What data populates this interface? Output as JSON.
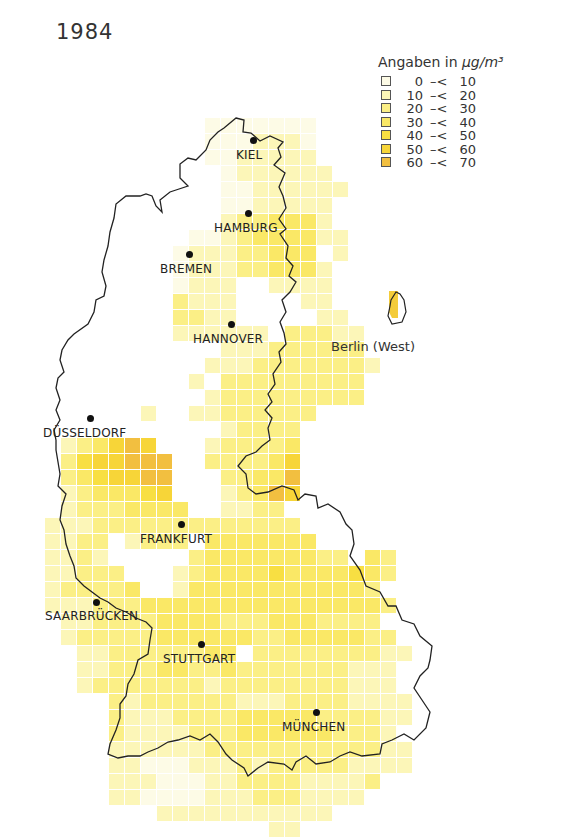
{
  "title": "1984",
  "legend": {
    "title_prefix": "Angaben in ",
    "title_unit": "µg/m³",
    "classes": [
      {
        "lo": "0",
        "sep": "–<",
        "hi": "10",
        "color": "#fdfbe6"
      },
      {
        "lo": "10",
        "sep": "–<",
        "hi": "20",
        "color": "#fcf6b8"
      },
      {
        "lo": "20",
        "sep": "–<",
        "hi": "30",
        "color": "#fbef86"
      },
      {
        "lo": "30",
        "sep": "–<",
        "hi": "40",
        "color": "#fae866"
      },
      {
        "lo": "40",
        "sep": "–<",
        "hi": "50",
        "color": "#f8df42"
      },
      {
        "lo": "50",
        "sep": "–<",
        "hi": "60",
        "color": "#f7d538"
      },
      {
        "lo": "60",
        "sep": "–<",
        "hi": "70",
        "color": "#f2bf40"
      }
    ]
  },
  "cities": [
    {
      "name": "KIEL",
      "dot": [
        253,
        140
      ],
      "label": [
        236,
        148
      ]
    },
    {
      "name": "HAMBURG",
      "dot": [
        248,
        213
      ],
      "label": [
        214,
        221
      ]
    },
    {
      "name": "BREMEN",
      "dot": [
        189,
        254
      ],
      "label": [
        160,
        262
      ]
    },
    {
      "name": "HANNOVER",
      "dot": [
        231,
        324
      ],
      "label": [
        193,
        332
      ]
    },
    {
      "name": "DÜSSELDORF",
      "dot": [
        90,
        418
      ],
      "label": [
        43,
        426
      ]
    },
    {
      "name": "FRANKFURT",
      "dot": [
        181,
        524
      ],
      "label": [
        140,
        532
      ]
    },
    {
      "name": "SAARBRÜCKEN",
      "dot": [
        96,
        602
      ],
      "label": [
        45,
        609
      ]
    },
    {
      "name": "STUTTGART",
      "dot": [
        201,
        644
      ],
      "label": [
        163,
        652
      ]
    },
    {
      "name": "MÜNCHEN",
      "dot": [
        316,
        712
      ],
      "label": [
        282,
        720
      ]
    }
  ],
  "berlin_label": "Berlin (West)",
  "grid": {
    "origin": [
      45,
      118
    ],
    "cell": 16,
    "rows": [
      "..........0000000........",
      "..........0001110........",
      "..........0011111........",
      "...........0111111.......",
      "...........00111111......",
      "...........0011111.......",
      "...........1223331.......",
      ".........0012333311......",
      "........011122333.1......",
      "........0111223331.......",
      "........0111..1111.......",
      "........2111....11.......",
      "........2211.....11......",
      "........111111.22211.....",
      "...........111222222.....",
      "..........11122222221....",
      ".........1.222222222.....",
      "..........1222222222.....",
      "......1..11222222........",
      "...........12222.........",
      ".123565...122223.........",
      ".2455666..222235.........",
      ".2345566...22336.........",
      ".1233345...12365.........",
      ".12223333..1122..........",
      "1112222222222222.........",
      "1122.1222.3333333........",
      "1121.....2333333322.32...",
      "11222...12333343333432...",
      "122223..1333333333332....",
      "1112223333333333333332...",
      ".11222233332223332222....",
      ".122222333333223333322...",
      "..1122222233.2222222211..",
      "..11222332232222222111...",
      "..12222222122222222111...",
      "....2122222211122221111..",
      "....2111222233333222211..",
      "....211112223333332221...",
      "....1111112222222222211..",
      "....1100011121222221111..",
      "....11100011222211112....",
      "....1100001112221111.....",
      ".......11111111111.......",
      "..............11........."
    ]
  }
}
